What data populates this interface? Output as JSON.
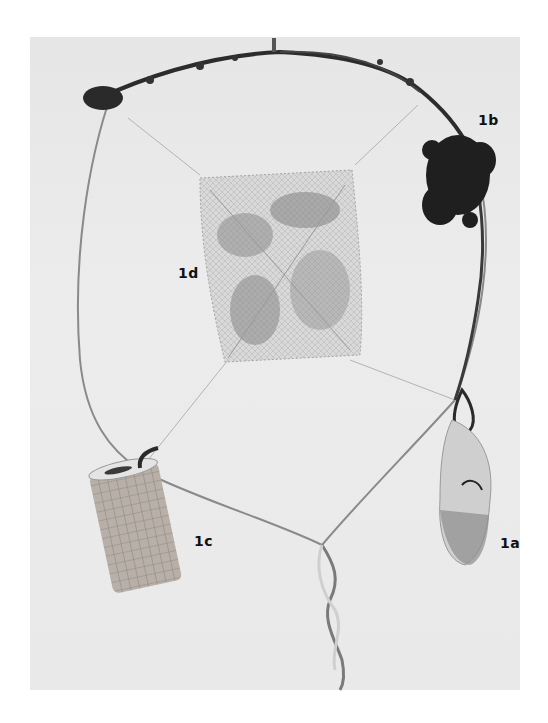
{
  "figure": {
    "background_color": "#ffffff",
    "photo_background_color": "#e8e8e8",
    "labels": {
      "a": "1a",
      "b": "1b",
      "c": "1c",
      "d": "1d"
    },
    "label_positions": {
      "a": {
        "x": 500,
        "y": 535
      },
      "b": {
        "x": 478,
        "y": 112
      },
      "c": {
        "x": 194,
        "y": 533
      },
      "d": {
        "x": 178,
        "y": 265
      }
    },
    "objects": [
      {
        "id": "1a",
        "description": "small mesh bag with specimen, tied to hoop on right"
      },
      {
        "id": "1b",
        "description": "clump of dark vegetation attached at upper right of hoop"
      },
      {
        "id": "1c",
        "description": "cylindrical mesh container hanging at lower left"
      },
      {
        "id": "1d",
        "description": "square mesh pouch with leaf litter, suspended in hoop center"
      }
    ]
  }
}
